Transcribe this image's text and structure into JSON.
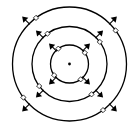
{
  "diagram": {
    "width": 132,
    "height": 129,
    "background": "#ffffff",
    "stroke_color": "#000000",
    "center": {
      "x": 69.5,
      "y": 64
    },
    "center_dot_radius": 1.4,
    "circles": [
      {
        "name": "inner",
        "radius": 19
      },
      {
        "name": "middle",
        "radius": 37.5
      },
      {
        "name": "outer",
        "radius": 57
      }
    ],
    "directions_deg": [
      -135,
      -45,
      45,
      135
    ],
    "arrow_length": 10,
    "arrow_head_size": 3.5,
    "marker": {
      "shape": "diamond",
      "size": 2.6,
      "fill": "#ffffff",
      "offset_deg": 9
    }
  }
}
